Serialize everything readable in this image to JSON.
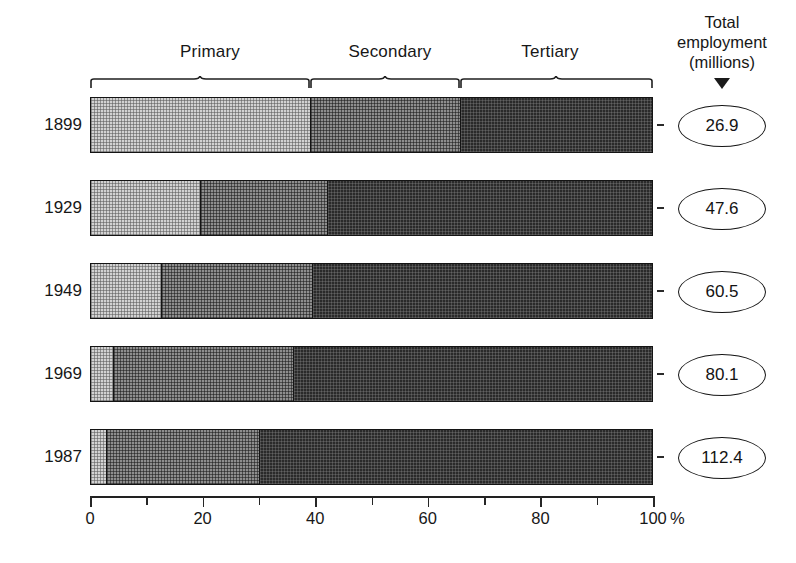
{
  "chart_data": {
    "type": "bar",
    "orientation": "horizontal",
    "stacked": true,
    "stack_mode": "percent",
    "title": "",
    "xlabel": "%",
    "ylabel": "",
    "xlim": [
      0,
      100
    ],
    "grid": false,
    "legend_position": "top-brace-annotations",
    "categories": [
      "1899",
      "1929",
      "1949",
      "1969",
      "1987"
    ],
    "series": [
      {
        "name": "Primary",
        "values": [
          39.0,
          19.4,
          12.4,
          3.9,
          2.7
        ]
      },
      {
        "name": "Secondary",
        "values": [
          26.8,
          22.6,
          27.0,
          32.1,
          27.3
        ]
      },
      {
        "name": "Tertiary",
        "values": [
          34.2,
          58.0,
          60.6,
          64.0,
          70.0
        ]
      }
    ],
    "annotations": {
      "total_employment_label": "Total employment (millions)",
      "totals": [
        26.9,
        47.6,
        60.5,
        80.1,
        112.4
      ]
    },
    "x_ticks": [
      0,
      10,
      20,
      30,
      40,
      50,
      60,
      70,
      80,
      90,
      100
    ],
    "x_tick_labels": [
      "0",
      "",
      "20",
      "",
      "40",
      "",
      "60",
      "",
      "80",
      "",
      "100"
    ]
  },
  "groups": [
    {
      "label": "Primary",
      "start_pct": 0,
      "end_pct": 39
    },
    {
      "label": "Secondary",
      "start_pct": 39,
      "end_pct": 66
    },
    {
      "label": "Tertiary",
      "start_pct": 66,
      "end_pct": 100
    }
  ],
  "total_caption": {
    "line1": "Total",
    "line2": "employment",
    "line3": "(millions)"
  },
  "rows": [
    {
      "year": "1899",
      "total": "26.9",
      "segments": [
        {
          "name": "Primary",
          "pct": 39.0
        },
        {
          "name": "Secondary",
          "pct": 26.8
        },
        {
          "name": "Tertiary",
          "pct": 34.2
        }
      ]
    },
    {
      "year": "1929",
      "total": "47.6",
      "segments": [
        {
          "name": "Primary",
          "pct": 19.4
        },
        {
          "name": "Secondary",
          "pct": 22.6
        },
        {
          "name": "Tertiary",
          "pct": 58.0
        }
      ]
    },
    {
      "year": "1949",
      "total": "60.5",
      "segments": [
        {
          "name": "Primary",
          "pct": 12.4
        },
        {
          "name": "Secondary",
          "pct": 27.0
        },
        {
          "name": "Tertiary",
          "pct": 60.6
        }
      ]
    },
    {
      "year": "1969",
      "total": "80.1",
      "segments": [
        {
          "name": "Primary",
          "pct": 3.9
        },
        {
          "name": "Secondary",
          "pct": 32.1
        },
        {
          "name": "Tertiary",
          "pct": 64.0
        }
      ]
    },
    {
      "year": "1987",
      "total": "112.4",
      "segments": [
        {
          "name": "Primary",
          "pct": 2.7
        },
        {
          "name": "Secondary",
          "pct": 27.3
        },
        {
          "name": "Tertiary",
          "pct": 70.0
        }
      ]
    }
  ],
  "axis": {
    "ticks": [
      {
        "value": 0,
        "label": "0"
      },
      {
        "value": 10,
        "label": ""
      },
      {
        "value": 20,
        "label": "20"
      },
      {
        "value": 30,
        "label": ""
      },
      {
        "value": 40,
        "label": "40"
      },
      {
        "value": 50,
        "label": ""
      },
      {
        "value": 60,
        "label": "60"
      },
      {
        "value": 70,
        "label": ""
      },
      {
        "value": 80,
        "label": "80"
      },
      {
        "value": 90,
        "label": ""
      },
      {
        "value": 100,
        "label": "100"
      }
    ],
    "unit": "%"
  },
  "colors": {
    "primary": "#d2d2d2",
    "secondary": "#8e8e8e",
    "tertiary": "#2a2a2a",
    "outline": "#141414",
    "text": "#171717",
    "background": "#ffffff"
  }
}
